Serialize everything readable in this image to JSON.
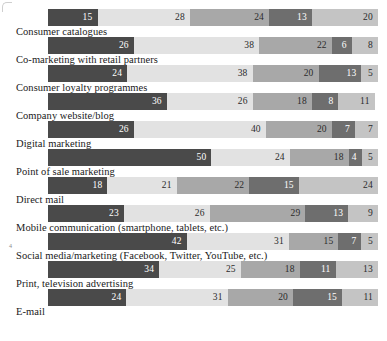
{
  "chart_data": {
    "type": "bar",
    "title": "",
    "subtitle": "",
    "xlabel": "",
    "ylabel": "",
    "orientation": "horizontal",
    "stacked": true,
    "normalized": true,
    "xlim": [
      0,
      100
    ],
    "grid": false,
    "legend_position": "none",
    "series": [
      {
        "name": "segment-1",
        "color": "#4a4a4a",
        "values": [
          15,
          26,
          24,
          36,
          26,
          50,
          18,
          23,
          42,
          34,
          24
        ]
      },
      {
        "name": "segment-2",
        "color": "#e2e2e2",
        "values": [
          28,
          38,
          38,
          26,
          40,
          24,
          21,
          26,
          31,
          25,
          31
        ]
      },
      {
        "name": "segment-3",
        "color": "#a8a8a8",
        "values": [
          24,
          22,
          20,
          18,
          20,
          18,
          22,
          29,
          15,
          18,
          20
        ]
      },
      {
        "name": "segment-4",
        "color": "#6e6e6e",
        "values": [
          13,
          6,
          13,
          8,
          7,
          4,
          15,
          13,
          7,
          11,
          15
        ]
      },
      {
        "name": "segment-5",
        "color": "#c4c4c4",
        "values": [
          20,
          8,
          5,
          11,
          7,
          5,
          24,
          9,
          5,
          13,
          11
        ]
      }
    ],
    "categories": [
      "Consumer catalogues",
      "Co-marketing with retail partners",
      "Consumer loyalty programmes",
      "Company website/blog",
      "Digital marketing",
      "Point of sale marketing",
      "Direct mail",
      "Mobile communication (smartphone, tablets, etc.)",
      "Social media/marketing (Facebook, Twitter, YouTube, etc.)",
      "Print, television advertising",
      "E-mail"
    ]
  },
  "rows": [
    {
      "label": "Consumer catalogues",
      "segments": [
        {
          "value": "15",
          "pct": 15,
          "cls": "s1"
        },
        {
          "value": "28",
          "pct": 28,
          "cls": "s2"
        },
        {
          "value": "24",
          "pct": 24,
          "cls": "s3"
        },
        {
          "value": "13",
          "pct": 13,
          "cls": "s4"
        },
        {
          "value": "20",
          "pct": 20,
          "cls": "s5"
        }
      ]
    },
    {
      "label": "Co-marketing with retail partners",
      "segments": [
        {
          "value": "26",
          "pct": 26,
          "cls": "s1"
        },
        {
          "value": "38",
          "pct": 38,
          "cls": "s2"
        },
        {
          "value": "22",
          "pct": 22,
          "cls": "s3"
        },
        {
          "value": "6",
          "pct": 6,
          "cls": "s4"
        },
        {
          "value": "8",
          "pct": 8,
          "cls": "s5"
        }
      ]
    },
    {
      "label": "Consumer loyalty programmes",
      "segments": [
        {
          "value": "24",
          "pct": 24,
          "cls": "s1"
        },
        {
          "value": "38",
          "pct": 38,
          "cls": "s2"
        },
        {
          "value": "20",
          "pct": 20,
          "cls": "s3"
        },
        {
          "value": "13",
          "pct": 13,
          "cls": "s4"
        },
        {
          "value": "5",
          "pct": 5,
          "cls": "s5"
        }
      ]
    },
    {
      "label": "Company website/blog",
      "segments": [
        {
          "value": "36",
          "pct": 36,
          "cls": "s1"
        },
        {
          "value": "26",
          "pct": 26,
          "cls": "s2"
        },
        {
          "value": "18",
          "pct": 18,
          "cls": "s3"
        },
        {
          "value": "8",
          "pct": 8,
          "cls": "s4"
        },
        {
          "value": "11",
          "pct": 11,
          "cls": "s5"
        }
      ]
    },
    {
      "label": "Digital marketing",
      "segments": [
        {
          "value": "26",
          "pct": 26,
          "cls": "s1"
        },
        {
          "value": "40",
          "pct": 40,
          "cls": "s2"
        },
        {
          "value": "20",
          "pct": 20,
          "cls": "s3"
        },
        {
          "value": "7",
          "pct": 7,
          "cls": "s4"
        },
        {
          "value": "7",
          "pct": 7,
          "cls": "s5"
        }
      ]
    },
    {
      "label": "Point of sale marketing",
      "segments": [
        {
          "value": "50",
          "pct": 50,
          "cls": "s1"
        },
        {
          "value": "24",
          "pct": 24,
          "cls": "s2"
        },
        {
          "value": "18",
          "pct": 18,
          "cls": "s3"
        },
        {
          "value": "4",
          "pct": 4,
          "cls": "s4"
        },
        {
          "value": "5",
          "pct": 5,
          "cls": "s5"
        }
      ]
    },
    {
      "label": "Direct mail",
      "segments": [
        {
          "value": "18",
          "pct": 18,
          "cls": "s1"
        },
        {
          "value": "21",
          "pct": 21,
          "cls": "s2"
        },
        {
          "value": "22",
          "pct": 22,
          "cls": "s3"
        },
        {
          "value": "15",
          "pct": 15,
          "cls": "s4"
        },
        {
          "value": "24",
          "pct": 24,
          "cls": "s5"
        }
      ]
    },
    {
      "label": "Mobile communication (smartphone, tablets, etc.)",
      "segments": [
        {
          "value": "23",
          "pct": 23,
          "cls": "s1"
        },
        {
          "value": "26",
          "pct": 26,
          "cls": "s2"
        },
        {
          "value": "29",
          "pct": 29,
          "cls": "s3"
        },
        {
          "value": "13",
          "pct": 13,
          "cls": "s4"
        },
        {
          "value": "9",
          "pct": 9,
          "cls": "s5"
        }
      ]
    },
    {
      "label": "Social media/marketing (Facebook, Twitter, YouTube, etc.)",
      "segments": [
        {
          "value": "42",
          "pct": 42,
          "cls": "s1"
        },
        {
          "value": "31",
          "pct": 31,
          "cls": "s2"
        },
        {
          "value": "15",
          "pct": 15,
          "cls": "s3"
        },
        {
          "value": "7",
          "pct": 7,
          "cls": "s4"
        },
        {
          "value": "5",
          "pct": 5,
          "cls": "s5"
        }
      ]
    },
    {
      "label": "Print, television advertising",
      "segments": [
        {
          "value": "34",
          "pct": 34,
          "cls": "s1"
        },
        {
          "value": "25",
          "pct": 25,
          "cls": "s2"
        },
        {
          "value": "18",
          "pct": 18,
          "cls": "s3"
        },
        {
          "value": "11",
          "pct": 11,
          "cls": "s4"
        },
        {
          "value": "13",
          "pct": 13,
          "cls": "s5"
        }
      ]
    },
    {
      "label": "E-mail",
      "segments": [
        {
          "value": "24",
          "pct": 24,
          "cls": "s1"
        },
        {
          "value": "31",
          "pct": 31,
          "cls": "s2"
        },
        {
          "value": "20",
          "pct": 20,
          "cls": "s3"
        },
        {
          "value": "15",
          "pct": 15,
          "cls": "s4"
        },
        {
          "value": "11",
          "pct": 11,
          "cls": "s5"
        }
      ]
    }
  ],
  "marks": {
    "tick": "4"
  }
}
